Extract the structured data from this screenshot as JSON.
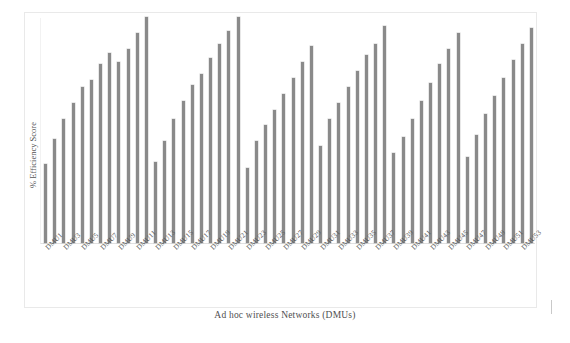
{
  "chart_data": {
    "type": "bar",
    "title": "",
    "xlabel": "Ad hoc wireless Networks (DMUs)",
    "ylabel": "% Efficiency Score",
    "ylim": [
      0,
      100
    ],
    "grid": false,
    "legend": "none",
    "bar_color": "#8a8a8a",
    "categories": [
      "DMU1",
      "DMU2",
      "DMU3",
      "DMU4",
      "DMU5",
      "DMU6",
      "DMU7",
      "DMU8",
      "DMU9",
      "DMU10",
      "DMU11",
      "DMU12",
      "DMU13",
      "DMU14",
      "DMU15",
      "DMU16",
      "DMU17",
      "DMU18",
      "DMU19",
      "DMU20",
      "DMU21",
      "DMU22",
      "DMU23",
      "DMU24",
      "DMU25",
      "DMU26",
      "DMU27",
      "DMU28",
      "DMU29",
      "DMU30",
      "DMU31",
      "DMU32",
      "DMU33",
      "DMU34",
      "DMU35",
      "DMU36",
      "DMU37",
      "DMU38",
      "DMU39",
      "DMU40",
      "DMU41",
      "DMU42",
      "DMU43",
      "DMU44",
      "DMU45",
      "DMU46",
      "DMU47",
      "DMU48",
      "DMU49",
      "DMU50",
      "DMU51",
      "DMU52",
      "DMU53",
      "DMU54"
    ],
    "values": [
      35,
      46,
      55,
      62,
      69,
      72,
      79,
      84,
      80,
      86,
      93,
      100,
      36,
      45,
      55,
      63,
      70,
      75,
      82,
      88,
      94,
      100,
      33,
      45,
      52,
      59,
      66,
      73,
      80,
      87,
      43,
      55,
      62,
      69,
      76,
      83,
      88,
      96,
      40,
      47,
      55,
      63,
      71,
      79,
      86,
      93,
      38,
      48,
      57,
      65,
      73,
      81,
      88,
      95
    ],
    "visible_tick_labels": [
      "DMU1",
      "DMU3",
      "DMU5",
      "DMU7",
      "DMU9",
      "DMU11",
      "DMU13",
      "DMU15",
      "DMU17",
      "DMU19",
      "DMU21",
      "DMU23",
      "DMU25",
      "DMU27",
      "DMU29",
      "DMU31",
      "DMU33",
      "DMU35",
      "DMU37",
      "DMU39",
      "DMU41",
      "DMU43",
      "DMU45",
      "DMU47",
      "DMU49",
      "DMU51",
      "DMU53"
    ]
  },
  "axes": {
    "y_title": "% Efficiency Score",
    "x_title": "Ad hoc wireless Networks (DMUs)"
  }
}
